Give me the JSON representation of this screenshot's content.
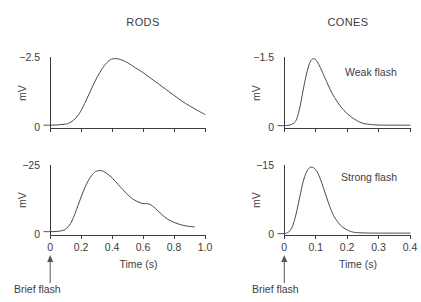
{
  "figure": {
    "column_titles": {
      "left": "RODS",
      "right": "CONES"
    },
    "annotations": {
      "weak_flash": "Weak flash",
      "strong_flash": "Strong flash",
      "brief_flash_left": "Brief flash",
      "brief_flash_right": "Brief flash"
    },
    "colors": {
      "trace": "#4a4a4a",
      "axis": "#3d3d3d",
      "text": "#3d3d3d",
      "background": "#ffffff"
    }
  },
  "chart_data": [
    {
      "id": "rods-weak",
      "type": "line",
      "title": "RODS",
      "subtitle": "Weak flash",
      "xlabel": "",
      "ylabel": "mV",
      "xlim": [
        -0.04,
        1.0
      ],
      "ylim": [
        0,
        2.5
      ],
      "y_tick_labels": [
        "0",
        "−2.5"
      ],
      "y_ticks": [
        0,
        2.5
      ],
      "x_ticks": [
        0,
        0.2,
        0.4,
        0.6,
        0.8,
        1.0
      ],
      "x_tick_labels": [],
      "grid": false,
      "note": "Response amplitude plotted downward-positive; peak near 0.4 s",
      "x": [
        -0.04,
        0.0,
        0.05,
        0.1,
        0.12,
        0.15,
        0.18,
        0.2,
        0.23,
        0.26,
        0.29,
        0.32,
        0.35,
        0.38,
        0.4,
        0.43,
        0.46,
        0.5,
        0.55,
        0.6,
        0.65,
        0.7,
        0.75,
        0.8,
        0.85,
        0.9,
        0.95,
        1.0
      ],
      "y": [
        0.1,
        0.1,
        0.11,
        0.14,
        0.17,
        0.27,
        0.45,
        0.62,
        0.95,
        1.3,
        1.65,
        1.95,
        2.2,
        2.37,
        2.43,
        2.44,
        2.4,
        2.3,
        2.12,
        1.95,
        1.75,
        1.55,
        1.35,
        1.15,
        0.95,
        0.78,
        0.62,
        0.48
      ]
    },
    {
      "id": "cones-weak",
      "type": "line",
      "title": "CONES",
      "subtitle": "Weak flash",
      "xlabel": "",
      "ylabel": "mV",
      "xlim": [
        -0.02,
        0.4
      ],
      "ylim": [
        0,
        1.5
      ],
      "y_tick_labels": [
        "0",
        "−1.5"
      ],
      "y_ticks": [
        0,
        1.5
      ],
      "x_ticks": [
        0,
        0.1,
        0.2,
        0.3,
        0.4
      ],
      "x_tick_labels": [],
      "grid": false,
      "note": "Faster kinetics than rods; peak near 0.08 s, returns to baseline by ~0.25 s",
      "x": [
        -0.02,
        0.0,
        0.015,
        0.03,
        0.04,
        0.05,
        0.06,
        0.07,
        0.08,
        0.09,
        0.1,
        0.11,
        0.12,
        0.13,
        0.15,
        0.17,
        0.19,
        0.21,
        0.23,
        0.25,
        0.28,
        0.32,
        0.36,
        0.4
      ],
      "y": [
        0.05,
        0.05,
        0.06,
        0.1,
        0.2,
        0.45,
        0.8,
        1.12,
        1.36,
        1.46,
        1.44,
        1.34,
        1.2,
        1.05,
        0.76,
        0.54,
        0.37,
        0.25,
        0.16,
        0.1,
        0.07,
        0.06,
        0.06,
        0.06
      ]
    },
    {
      "id": "rods-strong",
      "type": "line",
      "title": "RODS",
      "subtitle": "Strong flash",
      "xlabel": "Time (s)",
      "ylabel": "mV",
      "xlim": [
        -0.04,
        1.0
      ],
      "ylim": [
        0,
        25
      ],
      "y_tick_labels": [
        "0",
        "−25"
      ],
      "y_ticks": [
        0,
        25
      ],
      "x_ticks": [
        0,
        0.2,
        0.4,
        0.6,
        0.8,
        1.0
      ],
      "x_tick_labels": [
        "0",
        "0.2",
        "0.4",
        "0.6",
        "0.8",
        "1.0"
      ],
      "grid": false,
      "note": "Saturating response with prolonged plateau/shoulder near 0.55-0.65 s",
      "x": [
        -0.04,
        0.0,
        0.05,
        0.09,
        0.12,
        0.14,
        0.16,
        0.18,
        0.2,
        0.22,
        0.25,
        0.28,
        0.3,
        0.33,
        0.36,
        0.4,
        0.44,
        0.47,
        0.5,
        0.53,
        0.56,
        0.6,
        0.63,
        0.66,
        0.7,
        0.74,
        0.78,
        0.83,
        0.88,
        0.93
      ],
      "y": [
        1.2,
        1.2,
        1.3,
        1.8,
        3.2,
        5.0,
        7.6,
        10.6,
        13.6,
        16.4,
        19.8,
        22.0,
        22.8,
        23.0,
        22.2,
        20.4,
        18.0,
        16.2,
        14.4,
        13.0,
        12.0,
        11.2,
        11.2,
        10.4,
        8.4,
        6.4,
        5.0,
        3.9,
        3.2,
        2.9
      ]
    },
    {
      "id": "cones-strong",
      "type": "line",
      "title": "CONES",
      "subtitle": "Strong flash",
      "xlabel": "Time (s)",
      "ylabel": "mV",
      "xlim": [
        -0.02,
        0.4
      ],
      "ylim": [
        0,
        15
      ],
      "y_tick_labels": [
        "0",
        "−15"
      ],
      "y_ticks": [
        0,
        15
      ],
      "x_ticks": [
        0,
        0.1,
        0.2,
        0.3,
        0.4
      ],
      "x_tick_labels": [
        "0",
        "0.1",
        "0.2",
        "0.3",
        "0.4"
      ],
      "grid": false,
      "note": "Fast saturating response; peak near 0.08 s, fully recovered by ~0.22 s",
      "x": [
        -0.02,
        0.0,
        0.01,
        0.02,
        0.03,
        0.04,
        0.05,
        0.06,
        0.07,
        0.08,
        0.09,
        0.1,
        0.11,
        0.12,
        0.13,
        0.14,
        0.15,
        0.16,
        0.18,
        0.2,
        0.22,
        0.25,
        0.3,
        0.35,
        0.4
      ],
      "y": [
        0.3,
        0.3,
        0.5,
        1.1,
        2.6,
        5.2,
        8.4,
        11.4,
        13.4,
        14.4,
        14.5,
        14.0,
        12.8,
        11.0,
        9.0,
        7.0,
        5.2,
        3.8,
        2.0,
        1.1,
        0.6,
        0.45,
        0.4,
        0.4,
        0.4
      ]
    }
  ]
}
